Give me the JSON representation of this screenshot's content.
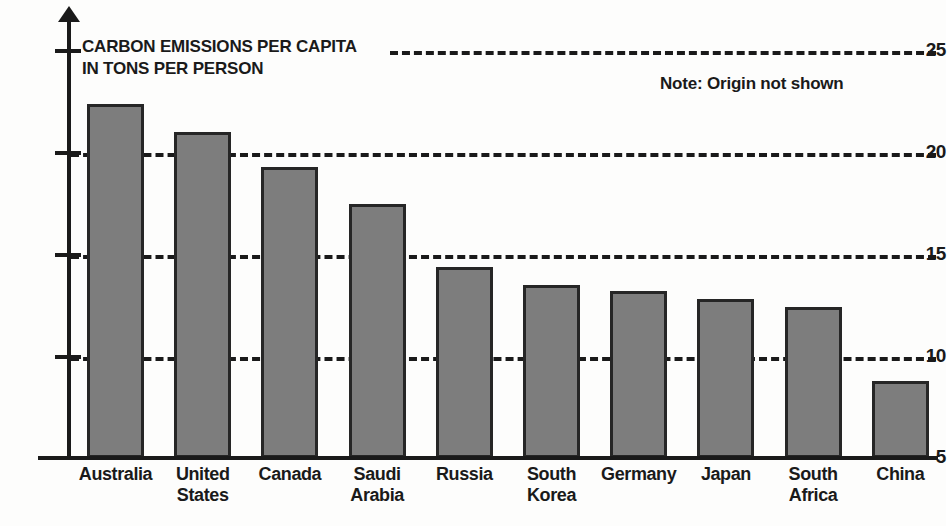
{
  "chart_data": {
    "type": "bar",
    "title": "CARBON EMISSIONS PER CAPITA\nIN TONS PER PERSON",
    "title_line1": "CARBON EMISSIONS PER CAPITA",
    "title_line2": "IN TONS PER PERSON",
    "note": "Note: Origin not shown",
    "xlabel": "",
    "ylabel": "",
    "ylim": [
      5,
      25
    ],
    "yticks": [
      25,
      20,
      15,
      10,
      5
    ],
    "ytick_labels": [
      "25",
      "20",
      "15",
      "10",
      "5"
    ],
    "grid": true,
    "grid_style": "dashed-horizontal",
    "legend": "none",
    "bar_fill_color": "#7d7d7d",
    "bar_edge_color": "#262626",
    "background_color": "#fdfdfc",
    "categories": [
      "Australia",
      "United States",
      "Canada",
      "Saudi Arabia",
      "Russia",
      "South Korea",
      "Germany",
      "Japan",
      "South Africa",
      "China"
    ],
    "category_labels": [
      "Australia",
      "United\nStates",
      "Canada",
      "Saudi\nArabia",
      "Russia",
      "South\nKorea",
      "Germany",
      "Japan",
      "South\nAfrica",
      "China"
    ],
    "values": [
      22.4,
      21.0,
      19.3,
      17.5,
      14.4,
      13.5,
      13.2,
      12.8,
      12.4,
      8.8
    ],
    "units": "tons per person"
  }
}
